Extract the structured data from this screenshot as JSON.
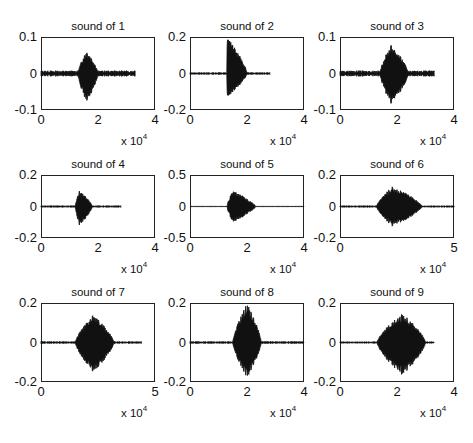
{
  "figure": {
    "layout": {
      "rows": 3,
      "cols": 3
    },
    "x_multiplier_label": "x 10",
    "x_multiplier_exp": "4"
  },
  "chart_data": [
    {
      "type": "line",
      "title": "sound of 1",
      "ylim": [
        -0.1,
        0.1
      ],
      "yticks": [
        "0.1",
        "0",
        "-0.1"
      ],
      "xlim": [
        0,
        4
      ],
      "xticks": [
        "0",
        "2",
        "4"
      ],
      "x_scale": "x 10^4",
      "signal": {
        "end": 3.3,
        "burst_start": 1.3,
        "burst_peak": 1.6,
        "burst_end": 2.0,
        "peak_pos": 0.065,
        "peak_neg": -0.085,
        "noise": 0.006
      }
    },
    {
      "type": "line",
      "title": "sound of 2",
      "ylim": [
        -0.2,
        0.2
      ],
      "yticks": [
        "0.2",
        "0",
        "-0.2"
      ],
      "xlim": [
        0,
        4
      ],
      "xticks": [
        "0",
        "2",
        "4"
      ],
      "x_scale": "x 10^4",
      "signal": {
        "end": 2.8,
        "burst_start": 1.3,
        "burst_peak": 1.3,
        "burst_end": 2.0,
        "peak_pos": 0.2,
        "peak_neg": -0.13,
        "noise": 0.004
      }
    },
    {
      "type": "line",
      "title": "sound of 3",
      "ylim": [
        -0.1,
        0.1
      ],
      "yticks": [
        "0.1",
        "0",
        "-0.1"
      ],
      "xlim": [
        0,
        4
      ],
      "xticks": [
        "0",
        "2",
        "4"
      ],
      "x_scale": "x 10^4",
      "signal": {
        "end": 3.3,
        "burst_start": 1.4,
        "burst_peak": 1.8,
        "burst_end": 2.4,
        "peak_pos": 0.08,
        "peak_neg": -0.085,
        "noise": 0.006
      }
    },
    {
      "type": "line",
      "title": "sound of 4",
      "ylim": [
        -0.2,
        0.2
      ],
      "yticks": [
        "0.2",
        "0",
        "-0.2"
      ],
      "xlim": [
        0,
        4
      ],
      "xticks": [
        "0",
        "2",
        "4"
      ],
      "x_scale": "x 10^4",
      "signal": {
        "end": 2.8,
        "burst_start": 1.2,
        "burst_peak": 1.35,
        "burst_end": 1.8,
        "peak_pos": 0.1,
        "peak_neg": -0.12,
        "noise": 0.004
      }
    },
    {
      "type": "line",
      "title": "sound of 5",
      "ylim": [
        -0.5,
        0.5
      ],
      "yticks": [
        "0.5",
        "0",
        "-0.5"
      ],
      "xlim": [
        0,
        4
      ],
      "xticks": [
        "0",
        "2",
        "4"
      ],
      "x_scale": "x 10^4",
      "signal": {
        "end": 4.0,
        "burst_start": 1.3,
        "burst_peak": 1.5,
        "burst_end": 2.3,
        "peak_pos": 0.25,
        "peak_neg": -0.25,
        "noise": 0.002
      }
    },
    {
      "type": "line",
      "title": "sound of 6",
      "ylim": [
        -0.2,
        0.2
      ],
      "yticks": [
        "0.2",
        "0",
        "-0.2"
      ],
      "xlim": [
        0,
        5
      ],
      "xticks": [
        "0",
        "5"
      ],
      "x_scale": "x 10^4",
      "signal": {
        "end": 5.0,
        "burst_start": 1.6,
        "burst_peak": 2.3,
        "burst_end": 3.6,
        "peak_pos": 0.13,
        "peak_neg": -0.13,
        "noise": 0.004
      }
    },
    {
      "type": "line",
      "title": "sound of 7",
      "ylim": [
        -0.2,
        0.2
      ],
      "yticks": [
        "0.2",
        "0",
        "-0.2"
      ],
      "xlim": [
        0,
        5
      ],
      "xticks": [
        "0",
        "5"
      ],
      "x_scale": "x 10^4",
      "signal": {
        "end": 4.4,
        "burst_start": 1.5,
        "burst_peak": 2.3,
        "burst_end": 3.2,
        "peak_pos": 0.14,
        "peak_neg": -0.15,
        "noise": 0.004
      }
    },
    {
      "type": "line",
      "title": "sound of 8",
      "ylim": [
        -0.2,
        0.2
      ],
      "yticks": [
        "0.2",
        "0",
        "-0.2"
      ],
      "xlim": [
        0,
        4
      ],
      "xticks": [
        "0",
        "2",
        "4"
      ],
      "x_scale": "x 10^4",
      "signal": {
        "end": 4.0,
        "burst_start": 1.5,
        "burst_peak": 2.0,
        "burst_end": 2.5,
        "peak_pos": 0.2,
        "peak_neg": -0.18,
        "noise": 0.004
      }
    },
    {
      "type": "line",
      "title": "sound of 9",
      "ylim": [
        -0.2,
        0.2
      ],
      "yticks": [
        "0.2",
        "0",
        "-0.2"
      ],
      "xlim": [
        0,
        4
      ],
      "xticks": [
        "0",
        "2",
        "4"
      ],
      "x_scale": "x 10^4",
      "signal": {
        "end": 3.3,
        "burst_start": 1.3,
        "burst_peak": 2.2,
        "burst_end": 3.0,
        "peak_pos": 0.15,
        "peak_neg": -0.17,
        "noise": 0.003
      }
    }
  ]
}
